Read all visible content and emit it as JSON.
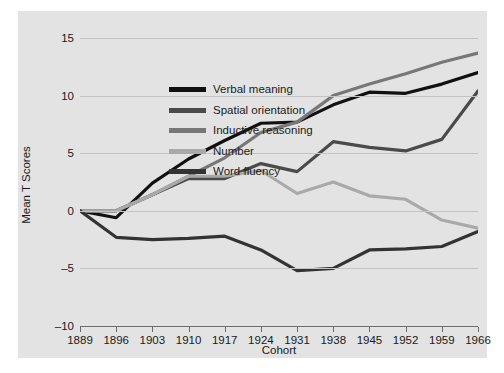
{
  "chart_data": {
    "type": "line",
    "title": "",
    "xlabel": "Cohort",
    "ylabel": "Mean T Scores",
    "categories": [
      1889,
      1896,
      1903,
      1910,
      1917,
      1924,
      1931,
      1938,
      1945,
      1952,
      1959,
      1966
    ],
    "xticklabels": [
      "1889",
      "1896",
      "1903",
      "1910",
      "1917",
      "1924",
      "1931",
      "1938",
      "1945",
      "1952",
      "1959",
      "1966"
    ],
    "yticklabels": [
      "15",
      "10",
      "5",
      "0",
      "-5",
      "-10"
    ],
    "ytickvalues": [
      15,
      10,
      5,
      0,
      -5,
      -10
    ],
    "ylim": [
      -10,
      15
    ],
    "xlim": [
      1889,
      1966
    ],
    "grid": "horizontal",
    "legend_position": "upper-left-inside",
    "series": [
      {
        "name": "Verbal meaning",
        "color": "#111111",
        "values": [
          0,
          -0.6,
          2.4,
          4.5,
          6.1,
          7.6,
          7.7,
          9.2,
          10.3,
          10.2,
          11.0,
          12.0
        ]
      },
      {
        "name": "Spatial orientation",
        "color": "#4a4a4a",
        "values": [
          0,
          0,
          1.4,
          2.8,
          2.8,
          4.1,
          3.4,
          6.0,
          5.5,
          5.2,
          6.2,
          10.4
        ]
      },
      {
        "name": "Inductive reasoning",
        "color": "#777777",
        "values": [
          0,
          0,
          1.4,
          3.0,
          4.6,
          6.8,
          7.7,
          10.0,
          11.0,
          11.9,
          12.9,
          13.7
        ]
      },
      {
        "name": "Number",
        "color": "#a9a9a9",
        "values": [
          0,
          0,
          1.4,
          3.0,
          3.0,
          3.5,
          1.5,
          2.5,
          1.3,
          1.0,
          -0.8,
          -1.5
        ]
      },
      {
        "name": "Word fluency",
        "color": "#333333",
        "values": [
          0,
          -2.3,
          -2.5,
          -2.4,
          -2.2,
          -3.4,
          -5.2,
          -5.0,
          -3.4,
          -3.3,
          -3.1,
          -1.8
        ]
      }
    ]
  },
  "axes": {
    "ylabel_text": "Mean T Scores",
    "xlabel_text": "Cohort"
  },
  "legend": {
    "items": [
      {
        "label": "Verbal meaning",
        "color": "#111111"
      },
      {
        "label": "Spatial orientation",
        "color": "#4a4a4a"
      },
      {
        "label": "Inductive reasoning",
        "color": "#777777"
      },
      {
        "label": "Number",
        "color": "#a9a9a9"
      },
      {
        "label": "Word fluency",
        "color": "#333333"
      }
    ]
  },
  "colors": {
    "figure_background": "#e3e3e3",
    "page_background": "#ffffff",
    "gridline": "#c4c4c4",
    "axis": "#6c6c6c",
    "text": "#1a1a1a"
  }
}
